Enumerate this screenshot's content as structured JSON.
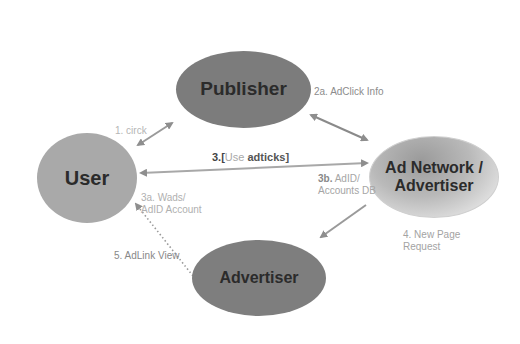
{
  "diagram": {
    "nodes": [
      {
        "id": "publisher",
        "label": "Publisher",
        "fill": "#7c7c7c"
      },
      {
        "id": "user",
        "label": "User",
        "fill": "#a9a9a9"
      },
      {
        "id": "adnetwork",
        "label_line1": "Ad Network /",
        "label_line2": "Advertiser",
        "fill": "#b9b9b9"
      },
      {
        "id": "advertiser",
        "label": "Advertiser",
        "fill": "#7e7e7e"
      }
    ],
    "edges": [
      {
        "from": "user",
        "to": "publisher",
        "label": "1. circk",
        "style": "solid",
        "bidirectional": true
      },
      {
        "from": "publisher",
        "to": "adnetwork",
        "label": "2a. AdClick Info",
        "style": "solid",
        "bidirectional": true
      },
      {
        "from": "user",
        "to": "adnetwork",
        "label_prefix": "3.[",
        "label_mid": "Use",
        "label_suffix": "adticks]",
        "style": "solid",
        "bidirectional": true
      },
      {
        "from": "adnetwork",
        "to": "user",
        "label_line1": "3a. Wads/",
        "label_line2": "AdID Account",
        "style": "solid"
      },
      {
        "from": "user",
        "to": "adnetwork",
        "label_prefix": "3b.",
        "label_rest": " AdID/",
        "label_line2": "Accounts DB",
        "style": "solid"
      },
      {
        "from": "adnetwork",
        "to": "advertiser",
        "label_line1": "4. New Page",
        "label_line2": "Request",
        "style": "solid"
      },
      {
        "from": "advertiser",
        "to": "user",
        "label": "5. AdLink View",
        "style": "dotted"
      }
    ],
    "colors": {
      "arrow": "#8e8e8e",
      "text_light": "#a5a5a5",
      "text_dark": "#2b2b2b"
    }
  }
}
